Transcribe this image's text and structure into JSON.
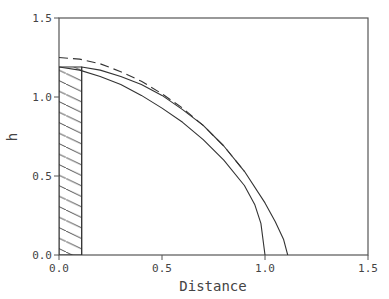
{
  "chart_data": {
    "type": "line",
    "title": "",
    "xlabel": "Distance",
    "ylabel": "h",
    "xlim": [
      0.0,
      1.5
    ],
    "ylim": [
      0.0,
      1.5
    ],
    "grid": false,
    "legend": null,
    "x_ticks": [
      "0.0",
      "0.5",
      "1.0",
      "1.5"
    ],
    "y_ticks": [
      "0.0",
      "0.5",
      "1.0",
      "1.5"
    ],
    "series": [
      {
        "name": "inner-profile",
        "style": "solid",
        "x": [
          0.0,
          0.1,
          0.2,
          0.3,
          0.4,
          0.5,
          0.6,
          0.7,
          0.8,
          0.9,
          0.95,
          0.98,
          1.0
        ],
        "y": [
          1.19,
          1.17,
          1.13,
          1.08,
          1.01,
          0.93,
          0.84,
          0.73,
          0.6,
          0.44,
          0.32,
          0.2,
          0.0
        ]
      },
      {
        "name": "outer-profile",
        "style": "solid",
        "x": [
          0.11,
          0.11,
          0.2,
          0.3,
          0.4,
          0.5,
          0.6,
          0.7,
          0.8,
          0.9,
          1.0,
          1.05,
          1.09,
          1.11
        ],
        "y": [
          0.0,
          1.19,
          1.17,
          1.13,
          1.08,
          1.01,
          0.92,
          0.82,
          0.69,
          0.53,
          0.33,
          0.21,
          0.1,
          0.0
        ]
      },
      {
        "name": "reference-profile",
        "style": "dashed",
        "x": [
          0.0,
          0.1,
          0.2,
          0.3,
          0.4,
          0.5,
          0.6,
          0.7,
          0.8,
          0.9
        ],
        "y": [
          1.25,
          1.24,
          1.21,
          1.16,
          1.1,
          1.02,
          0.93,
          0.82,
          0.69,
          0.53
        ]
      }
    ],
    "shaded_region": {
      "name": "hatched-block",
      "x": [
        0.0,
        0.11
      ],
      "y": [
        0.0,
        1.19
      ],
      "pattern": "diagonal-hatch"
    }
  },
  "colors": {
    "line": "#333333",
    "axis": "#555555",
    "text": "#444444",
    "background": "#ffffff"
  }
}
